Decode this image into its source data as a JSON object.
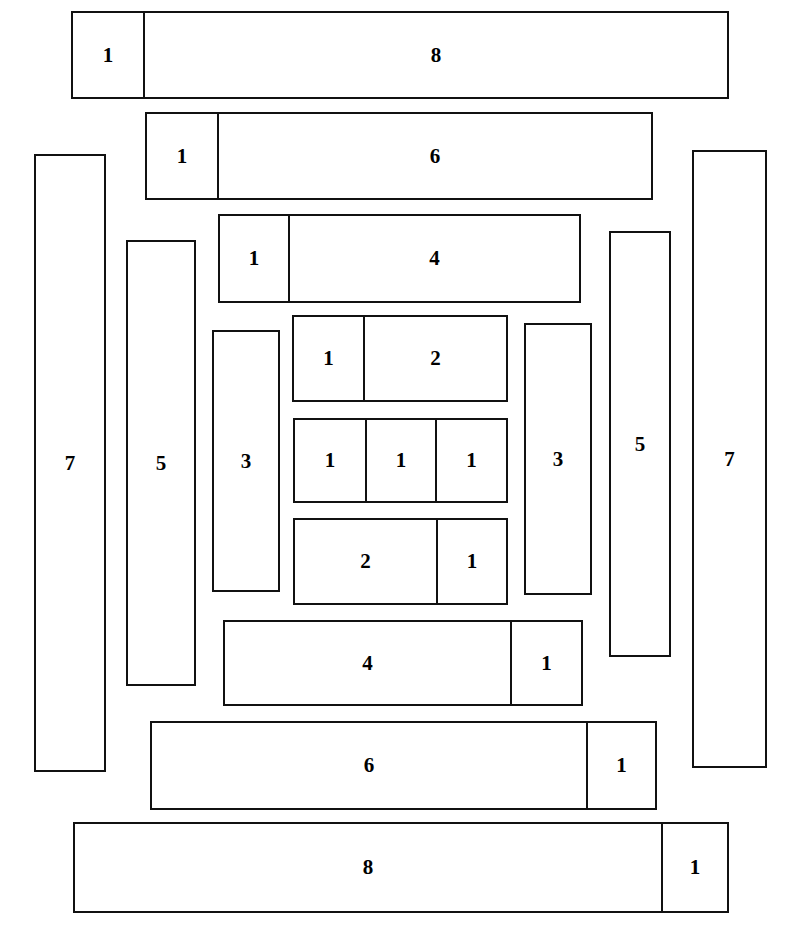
{
  "diagram": {
    "canvas": {
      "width": 802,
      "height": 936
    },
    "stroke_color": "#111111",
    "fill_color": "#ffffff",
    "rows": [
      {
        "name": "row-top-1-8",
        "x": 71,
        "y": 11,
        "width": 658,
        "height": 88,
        "cells": [
          {
            "label": "1",
            "width": 74
          },
          {
            "label": "8",
            "width": 584
          }
        ]
      },
      {
        "name": "row-1-6",
        "x": 145,
        "y": 112,
        "width": 508,
        "height": 88,
        "cells": [
          {
            "label": "1",
            "width": 74
          },
          {
            "label": "6",
            "width": 434
          }
        ]
      },
      {
        "name": "row-1-4",
        "x": 218,
        "y": 214,
        "width": 363,
        "height": 89,
        "cells": [
          {
            "label": "1",
            "width": 72
          },
          {
            "label": "4",
            "width": 291
          }
        ]
      },
      {
        "name": "row-1-2",
        "x": 292,
        "y": 315,
        "width": 216,
        "height": 87,
        "cells": [
          {
            "label": "1",
            "width": 73
          },
          {
            "label": "2",
            "width": 143
          }
        ]
      },
      {
        "name": "row-1-1-1",
        "x": 293,
        "y": 418,
        "width": 215,
        "height": 85,
        "cells": [
          {
            "label": "1",
            "width": 74
          },
          {
            "label": "1",
            "width": 70
          },
          {
            "label": "1",
            "width": 71
          }
        ]
      },
      {
        "name": "row-2-1",
        "x": 293,
        "y": 518,
        "width": 215,
        "height": 87,
        "cells": [
          {
            "label": "2",
            "width": 145
          },
          {
            "label": "1",
            "width": 70
          }
        ]
      },
      {
        "name": "row-4-1",
        "x": 223,
        "y": 620,
        "width": 360,
        "height": 86,
        "cells": [
          {
            "label": "4",
            "width": 289
          },
          {
            "label": "1",
            "width": 71
          }
        ]
      },
      {
        "name": "row-6-1",
        "x": 150,
        "y": 721,
        "width": 507,
        "height": 89,
        "cells": [
          {
            "label": "6",
            "width": 438
          },
          {
            "label": "1",
            "width": 69
          }
        ]
      },
      {
        "name": "row-bottom-8-1",
        "x": 73,
        "y": 822,
        "width": 656,
        "height": 91,
        "cells": [
          {
            "label": "8",
            "width": 590
          },
          {
            "label": "1",
            "width": 66
          }
        ]
      }
    ],
    "vertical_bars": [
      {
        "name": "bar-left-7",
        "label": "7",
        "x": 34,
        "y": 154,
        "width": 72,
        "height": 618
      },
      {
        "name": "bar-left-5",
        "label": "5",
        "x": 126,
        "y": 240,
        "width": 70,
        "height": 446
      },
      {
        "name": "bar-left-3",
        "label": "3",
        "x": 212,
        "y": 330,
        "width": 68,
        "height": 262
      },
      {
        "name": "bar-right-3",
        "label": "3",
        "x": 524,
        "y": 323,
        "width": 68,
        "height": 272
      },
      {
        "name": "bar-right-5",
        "label": "5",
        "x": 609,
        "y": 231,
        "width": 62,
        "height": 426
      },
      {
        "name": "bar-right-7",
        "label": "7",
        "x": 692,
        "y": 150,
        "width": 75,
        "height": 618
      }
    ]
  }
}
